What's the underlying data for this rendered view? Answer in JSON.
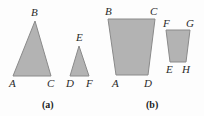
{
  "figure": {
    "background_color": "#fdfdfd",
    "shape_fill_color": "#b3b3b3",
    "shape_stroke_color": "#8a8a8a",
    "label_color": "#2a2a2a",
    "width": 204,
    "height": 116
  },
  "panels": [
    {
      "id": "a",
      "caption": "(a)",
      "caption_x": 42,
      "caption_y": 100,
      "shapes": [
        {
          "name": "triangle-abc",
          "type": "triangle",
          "points": "35,21 51,76 13,76",
          "vertices": [
            {
              "label": "B",
              "x": 31,
              "y": 7
            },
            {
              "label": "A",
              "x": 9,
              "y": 78
            },
            {
              "label": "C",
              "x": 47,
              "y": 78
            }
          ]
        },
        {
          "name": "triangle-def",
          "type": "triangle",
          "points": "79,46 89,76 70,76",
          "vertices": [
            {
              "label": "E",
              "x": 76,
              "y": 32
            },
            {
              "label": "D",
              "x": 66,
              "y": 78
            },
            {
              "label": "F",
              "x": 86,
              "y": 78
            }
          ]
        }
      ]
    },
    {
      "id": "b",
      "caption": "(b)",
      "caption_x": 146,
      "caption_y": 100,
      "shapes": [
        {
          "name": "trapezoid-abcd",
          "type": "trapezoid",
          "points": "108,19 155,19 148,75 116,75",
          "vertices": [
            {
              "label": "B",
              "x": 105,
              "y": 6
            },
            {
              "label": "C",
              "x": 150,
              "y": 6
            },
            {
              "label": "A",
              "x": 112,
              "y": 78
            },
            {
              "label": "D",
              "x": 144,
              "y": 78
            }
          ]
        },
        {
          "name": "trapezoid-fghe",
          "type": "trapezoid",
          "points": "166,30 190,30 186,62 170,62",
          "vertices": [
            {
              "label": "F",
              "x": 163,
              "y": 18
            },
            {
              "label": "G",
              "x": 186,
              "y": 18
            },
            {
              "label": "E",
              "x": 166,
              "y": 64
            },
            {
              "label": "H",
              "x": 182,
              "y": 64
            }
          ]
        }
      ]
    }
  ]
}
